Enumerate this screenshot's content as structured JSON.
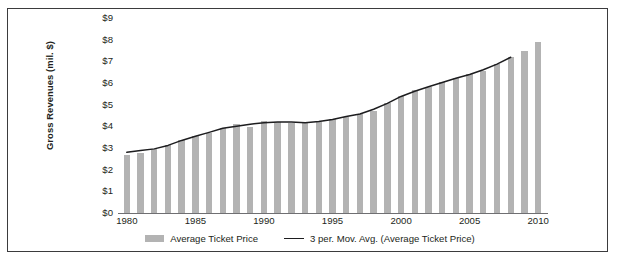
{
  "chart_data": {
    "type": "bar",
    "title": "",
    "xlabel": "",
    "ylabel": "Gross Revenues (mil. $)",
    "ylim": [
      0,
      9
    ],
    "xlim": [
      1980,
      2010
    ],
    "grid": false,
    "legend_position": "bottom",
    "y_ticks": [
      "$0",
      "$1",
      "$2",
      "$3",
      "$4",
      "$5",
      "$6",
      "$7",
      "$8",
      "$9"
    ],
    "y_tick_values": [
      0,
      1,
      2,
      3,
      4,
      5,
      6,
      7,
      8,
      9
    ],
    "x_ticks": [
      "1980",
      "1985",
      "1990",
      "1995",
      "2000",
      "2005",
      "2010"
    ],
    "x_tick_values": [
      1980,
      1985,
      1990,
      1995,
      2000,
      2005,
      2010
    ],
    "categories": [
      1980,
      1981,
      1982,
      1983,
      1984,
      1985,
      1986,
      1987,
      1988,
      1989,
      1990,
      1991,
      1992,
      1993,
      1994,
      1995,
      1996,
      1997,
      1998,
      1999,
      2000,
      2001,
      2002,
      2003,
      2004,
      2005,
      2006,
      2007,
      2008,
      2009,
      2010
    ],
    "series": [
      {
        "name": "Average Ticket Price",
        "type": "bar",
        "color": "#b3b3b3",
        "values": [
          2.69,
          2.78,
          2.94,
          3.15,
          3.36,
          3.55,
          3.71,
          3.91,
          4.11,
          3.97,
          4.23,
          4.21,
          4.15,
          4.14,
          4.18,
          4.35,
          4.42,
          4.59,
          4.69,
          5.08,
          5.39,
          5.66,
          5.81,
          6.03,
          6.21,
          6.41,
          6.55,
          6.88,
          7.18,
          7.5,
          7.89
        ]
      },
      {
        "name": "3 per. Mov. Avg. (Average Ticket Price)",
        "type": "line",
        "color": "#1d1d1f",
        "x": [
          1980,
          1981,
          1982,
          1983,
          1984,
          1985,
          1986,
          1987,
          1988,
          1989,
          1990,
          1991,
          1992,
          1993,
          1994,
          1995,
          1996,
          1997,
          1998,
          1999,
          2000,
          2001,
          2002,
          2003,
          2004,
          2005,
          2006,
          2007,
          2008
        ],
        "values": [
          2.8,
          2.88,
          2.96,
          3.12,
          3.35,
          3.54,
          3.72,
          3.91,
          4.0,
          4.1,
          4.17,
          4.2,
          4.2,
          4.16,
          4.22,
          4.32,
          4.45,
          4.57,
          4.79,
          5.06,
          5.38,
          5.62,
          5.83,
          6.02,
          6.22,
          6.39,
          6.61,
          6.87,
          7.19
        ]
      }
    ],
    "legend": [
      {
        "label": "Average Ticket Price",
        "marker": "bar-swatch",
        "color": "#b3b3b3"
      },
      {
        "label": "3 per. Mov. Avg. (Average Ticket Price)",
        "marker": "line-swatch",
        "color": "#1d1d1f"
      }
    ]
  },
  "colors": {
    "bar": "#b3b3b3",
    "line": "#1d1d1f",
    "border": "#3b3b3d",
    "axis": "#6f6f72",
    "text": "#231f20",
    "background": "#ffffff"
  }
}
